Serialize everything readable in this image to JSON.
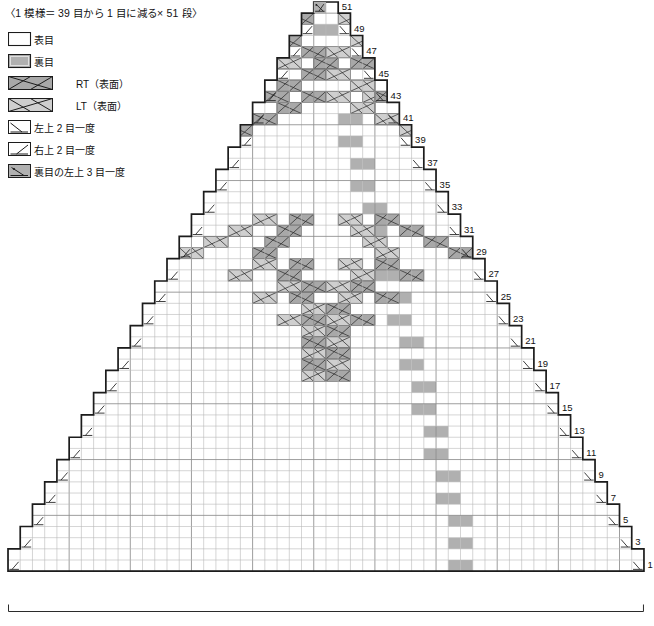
{
  "header": {
    "title": "〈1 模様＝ 39 目から 1 目に減る× 51 段〉"
  },
  "legend": {
    "items": [
      {
        "icon": "knit-stitch-icon",
        "label": "表目",
        "sym": "knit",
        "indent": false
      },
      {
        "icon": "purl-stitch-icon",
        "label": "裏目",
        "sym": "purl",
        "indent": false
      },
      {
        "icon": "right-twist-cable-icon",
        "label": "RT（表面）",
        "sym": "rt",
        "indent": true
      },
      {
        "icon": "left-twist-cable-icon",
        "label": "LT（表面）",
        "sym": "lt",
        "indent": true
      },
      {
        "icon": "left-over-dec2-icon",
        "label": "左上 2 目一度",
        "sym": "ssk",
        "indent": false
      },
      {
        "icon": "right-over-dec2-icon",
        "label": "右上 2 目一度",
        "sym": "k2tog",
        "indent": false
      },
      {
        "icon": "purl-left-over-dec3-icon",
        "label": "裏目の左上 3 目一度",
        "sym": "p3tog",
        "indent": false
      }
    ]
  },
  "chart": {
    "columns": 52,
    "rows": 51,
    "cell_w": 12.23,
    "cell_h": 11.16,
    "origin_x": 8,
    "origin_y": 2,
    "row_numbers": [
      1,
      3,
      5,
      7,
      9,
      11,
      13,
      15,
      17,
      19,
      21,
      23,
      25,
      27,
      29,
      31,
      33,
      35,
      37,
      39,
      41,
      43,
      45,
      47,
      49,
      51
    ],
    "colors": {
      "knit": "#ffffff",
      "purl": "#b0b0b0",
      "rt": "#a8a8a8",
      "lt": "#cfcfcf",
      "grid_minor": "#b9b9b9",
      "grid_major": "#8d8d8d",
      "outline": "#1c1c1c",
      "symbol": "#1c1c1c"
    },
    "purl_cells": [
      [
        51,
        26
      ],
      [
        49,
        25
      ],
      [
        49,
        26
      ],
      [
        47,
        25
      ],
      [
        47,
        26
      ],
      [
        45,
        24
      ],
      [
        45,
        25
      ],
      [
        43,
        24
      ],
      [
        43,
        25
      ],
      [
        41,
        23
      ],
      [
        41,
        24
      ],
      [
        39,
        23
      ],
      [
        39,
        24
      ],
      [
        37,
        22
      ],
      [
        37,
        23
      ],
      [
        35,
        22
      ],
      [
        35,
        23
      ],
      [
        33,
        21
      ],
      [
        33,
        22
      ],
      [
        31,
        21
      ],
      [
        31,
        22
      ],
      [
        29,
        20
      ],
      [
        29,
        21
      ],
      [
        27,
        20
      ],
      [
        27,
        21
      ],
      [
        25,
        19
      ],
      [
        25,
        20
      ],
      [
        23,
        19
      ],
      [
        23,
        20
      ],
      [
        21,
        18
      ],
      [
        21,
        19
      ],
      [
        19,
        18
      ],
      [
        19,
        19
      ],
      [
        17,
        17
      ],
      [
        17,
        18
      ],
      [
        15,
        17
      ],
      [
        15,
        18
      ],
      [
        13,
        16
      ],
      [
        13,
        17
      ],
      [
        11,
        16
      ],
      [
        11,
        17
      ],
      [
        9,
        15
      ],
      [
        9,
        16
      ],
      [
        7,
        15
      ],
      [
        7,
        16
      ],
      [
        5,
        14
      ],
      [
        5,
        15
      ],
      [
        3,
        14
      ],
      [
        3,
        15
      ],
      [
        1,
        14
      ],
      [
        1,
        15
      ]
    ],
    "cables": [
      {
        "row": 50,
        "col": -6,
        "type": "lt"
      },
      {
        "row": 50,
        "col": -3,
        "type": "rt"
      },
      {
        "row": 49,
        "col": -10,
        "type": "rt"
      },
      {
        "row": 48,
        "col": -8,
        "type": "lt"
      },
      {
        "row": 48,
        "col": -4,
        "type": "rt"
      },
      {
        "row": 47,
        "col": -6,
        "type": "lt"
      },
      {
        "row": 47,
        "col": -2,
        "type": "rt"
      },
      {
        "row": 46,
        "col": -4,
        "type": "lt"
      },
      {
        "row": 46,
        "col": -1,
        "type": "rt"
      },
      {
        "row": 45,
        "col": -12,
        "type": "rt"
      },
      {
        "row": 45,
        "col": -6,
        "type": "lt"
      },
      {
        "row": 45,
        "col": -2,
        "type": "rt"
      },
      {
        "row": 45,
        "col": 4,
        "type": "lt"
      },
      {
        "row": 44,
        "col": -14,
        "type": "rt"
      },
      {
        "row": 44,
        "col": -8,
        "type": "lt"
      },
      {
        "row": 44,
        "col": -4,
        "type": "rt"
      },
      {
        "row": 44,
        "col": 2,
        "type": "lt"
      },
      {
        "row": 43,
        "col": -13,
        "type": "rt"
      },
      {
        "row": 43,
        "col": -6,
        "type": "lt"
      },
      {
        "row": 43,
        "col": -2,
        "type": "rt"
      },
      {
        "row": 43,
        "col": 3,
        "type": "lt"
      },
      {
        "row": 42,
        "col": -16,
        "type": "rt"
      },
      {
        "row": 42,
        "col": -10,
        "type": "lt"
      },
      {
        "row": 42,
        "col": -4,
        "type": "rt"
      },
      {
        "row": 42,
        "col": 2,
        "type": "lt"
      },
      {
        "row": 42,
        "col": 8,
        "type": "rt"
      },
      {
        "row": 41,
        "col": -18,
        "type": "rt"
      },
      {
        "row": 41,
        "col": -12,
        "type": "lt"
      },
      {
        "row": 41,
        "col": -6,
        "type": "rt"
      },
      {
        "row": 41,
        "col": 4,
        "type": "lt"
      },
      {
        "row": 41,
        "col": 10,
        "type": "rt"
      },
      {
        "row": 40,
        "col": -20,
        "type": "rt"
      },
      {
        "row": 40,
        "col": -14,
        "type": "lt"
      },
      {
        "row": 40,
        "col": -8,
        "type": "rt"
      },
      {
        "row": 40,
        "col": 6,
        "type": "lt"
      },
      {
        "row": 40,
        "col": 12,
        "type": "rt"
      },
      {
        "row": 39,
        "col": -22,
        "type": "rt"
      },
      {
        "row": 39,
        "col": -16,
        "type": "lt"
      },
      {
        "row": 39,
        "col": -10,
        "type": "rt"
      },
      {
        "row": 39,
        "col": 8,
        "type": "lt"
      },
      {
        "row": 39,
        "col": 14,
        "type": "rt"
      },
      {
        "row": 38,
        "col": -24,
        "type": "rt"
      },
      {
        "row": 38,
        "col": -18,
        "type": "lt"
      },
      {
        "row": 38,
        "col": -12,
        "type": "rt"
      },
      {
        "row": 38,
        "col": 10,
        "type": "lt"
      },
      {
        "row": 38,
        "col": 16,
        "type": "rt"
      },
      {
        "row": 37,
        "col": -20,
        "type": "lt"
      },
      {
        "row": 37,
        "col": -14,
        "type": "rt"
      },
      {
        "row": 37,
        "col": 12,
        "type": "lt"
      },
      {
        "row": 37,
        "col": 18,
        "type": "rt"
      },
      {
        "row": 36,
        "col": -22,
        "type": "lt"
      },
      {
        "row": 36,
        "col": -16,
        "type": "rt"
      },
      {
        "row": 36,
        "col": 14,
        "type": "lt"
      },
      {
        "row": 36,
        "col": 20,
        "type": "rt"
      },
      {
        "row": 35,
        "col": -24,
        "type": "lt"
      },
      {
        "row": 35,
        "col": -18,
        "type": "rt"
      },
      {
        "row": 35,
        "col": 16,
        "type": "lt"
      },
      {
        "row": 35,
        "col": 22,
        "type": "rt"
      },
      {
        "row": 34,
        "col": -20,
        "type": "rt"
      },
      {
        "row": 34,
        "col": 18,
        "type": "lt"
      },
      {
        "row": 33,
        "col": -22,
        "type": "rt"
      },
      {
        "row": 33,
        "col": 20,
        "type": "lt"
      },
      {
        "row": 32,
        "col": -6,
        "type": "lt"
      },
      {
        "row": 32,
        "col": -3,
        "type": "rt"
      },
      {
        "row": 31,
        "col": -8,
        "type": "lt"
      },
      {
        "row": 31,
        "col": -4,
        "type": "rt"
      },
      {
        "row": 30,
        "col": -10,
        "type": "lt"
      },
      {
        "row": 30,
        "col": -5,
        "type": "rt"
      },
      {
        "row": 29,
        "col": -12,
        "type": "lt"
      },
      {
        "row": 29,
        "col": -6,
        "type": "rt"
      },
      {
        "row": 28,
        "col": -6,
        "type": "lt"
      },
      {
        "row": 28,
        "col": -3,
        "type": "rt"
      },
      {
        "row": 27,
        "col": -8,
        "type": "lt"
      },
      {
        "row": 27,
        "col": -4,
        "type": "rt"
      },
      {
        "row": 26,
        "col": -4,
        "type": "lt"
      },
      {
        "row": 26,
        "col": -2,
        "type": "rt"
      },
      {
        "row": 25,
        "col": -6,
        "type": "lt"
      },
      {
        "row": 25,
        "col": -3,
        "type": "rt"
      },
      {
        "row": 24,
        "col": -2,
        "type": "lt"
      },
      {
        "row": 24,
        "col": 0,
        "type": "rt"
      },
      {
        "row": 23,
        "col": -4,
        "type": "lt"
      },
      {
        "row": 23,
        "col": -2,
        "type": "rt"
      },
      {
        "row": 22,
        "col": -2,
        "type": "lt"
      },
      {
        "row": 21,
        "col": -2,
        "type": "rt"
      },
      {
        "row": 20,
        "col": -2,
        "type": "lt"
      },
      {
        "row": 19,
        "col": -2,
        "type": "rt"
      },
      {
        "row": 18,
        "col": -2,
        "type": "lt"
      }
    ],
    "left_decreases": {
      "type": "k2tog",
      "rows": [
        1,
        3,
        5,
        7,
        9,
        11,
        13,
        15,
        17,
        19,
        21,
        23,
        25,
        27,
        29,
        31,
        33,
        35,
        37,
        39,
        41,
        43,
        45,
        47,
        49
      ]
    },
    "right_decreases": {
      "type": "ssk",
      "rows": [
        1,
        3,
        5,
        7,
        9,
        11,
        13,
        15,
        17,
        19,
        21,
        23,
        25,
        27,
        29,
        31,
        33,
        35,
        37,
        39,
        41,
        43,
        45,
        47,
        49
      ]
    },
    "top_symbol": {
      "type": "p3tog",
      "row": 51
    }
  },
  "measure": {
    "bracket_label": ""
  }
}
